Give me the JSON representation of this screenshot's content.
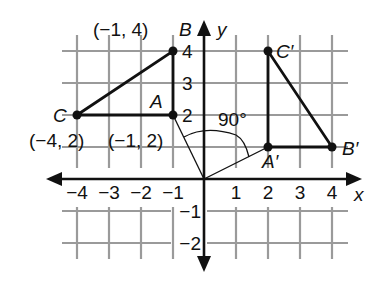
{
  "figure": {
    "axes": {
      "x_label": "x",
      "y_label": "y",
      "x_ticks": [
        "−4",
        "−3",
        "−2",
        "−1",
        "1",
        "2",
        "3",
        "4"
      ],
      "y_ticks": [
        "4",
        "3",
        "2",
        "−1",
        "−2"
      ],
      "x_range": [
        -4,
        4
      ],
      "y_range": [
        -2,
        4
      ]
    },
    "original_triangle": {
      "A": {
        "label": "A",
        "coord_label": "(−1, 2)",
        "x": -1,
        "y": 2
      },
      "B": {
        "label": "B",
        "coord_label": "(−1, 4)",
        "x": -1,
        "y": 4
      },
      "C": {
        "label": "C",
        "coord_label": "(−4, 2)",
        "x": -4,
        "y": 2
      }
    },
    "image_triangle": {
      "A_prime": {
        "label": "A′",
        "x": 2,
        "y": 1
      },
      "B_prime": {
        "label": "B′",
        "x": 4,
        "y": 1
      },
      "C_prime": {
        "label": "C′",
        "x": 2,
        "y": 4
      }
    },
    "rotation": {
      "angle_label": "90°",
      "center": [
        0,
        0
      ],
      "direction": "clockwise"
    }
  }
}
